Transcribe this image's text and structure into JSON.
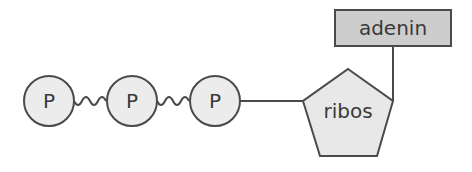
{
  "diagram": {
    "title": "",
    "colors": {
      "stroke": "#4a4a4a",
      "phosphate_fill": "#ececec",
      "ribose_fill": "#e8e8e8",
      "adenine_fill": "#cdcdcd",
      "text": "#3a3a3a"
    },
    "phosphates": [
      {
        "label": "P"
      },
      {
        "label": "P"
      },
      {
        "label": "P"
      }
    ],
    "bonds": [
      {
        "type": "high-energy (wavy)",
        "from": "P1",
        "to": "P2"
      },
      {
        "type": "high-energy (wavy)",
        "from": "P2",
        "to": "P3"
      },
      {
        "type": "single",
        "from": "P3",
        "to": "ribos"
      },
      {
        "type": "single",
        "from": "ribos",
        "to": "adenin"
      }
    ],
    "sugar": {
      "label": "ribos"
    },
    "base": {
      "label": "adenin"
    }
  }
}
